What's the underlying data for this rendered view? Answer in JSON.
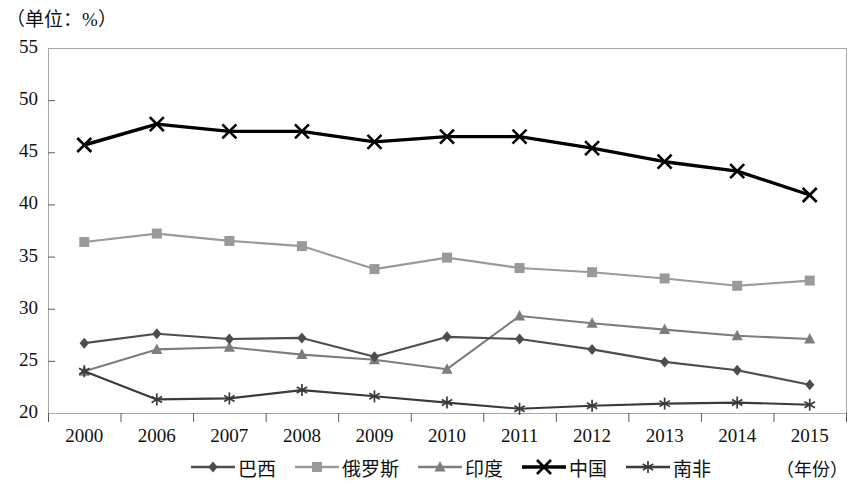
{
  "unit_label": "（单位：%）",
  "xaxis_caption": "（年份）",
  "chart_data": {
    "type": "line",
    "title": "",
    "subtitle": "",
    "xlabel": "（年份）",
    "ylabel": "（单位：%）",
    "categories": [
      "2000",
      "2006",
      "2007",
      "2008",
      "2009",
      "2010",
      "2011",
      "2012",
      "2013",
      "2014",
      "2015"
    ],
    "ylim": [
      20,
      55
    ],
    "yticks": [
      20,
      25,
      30,
      35,
      40,
      45,
      50,
      55
    ],
    "grid": false,
    "legend_position": "bottom",
    "series": [
      {
        "name": "巴西",
        "marker": "diamond",
        "color": "#4d4d4d",
        "values": [
          26.7,
          27.6,
          27.1,
          27.2,
          25.4,
          27.3,
          27.1,
          26.1,
          24.9,
          24.1,
          22.7
        ]
      },
      {
        "name": "俄罗斯",
        "marker": "square",
        "color": "#9a9a9a",
        "values": [
          36.4,
          37.2,
          36.5,
          36.0,
          33.8,
          34.9,
          33.9,
          33.5,
          32.9,
          32.2,
          32.7
        ]
      },
      {
        "name": "印度",
        "marker": "triangle",
        "color": "#7d7d7d",
        "values": [
          24.0,
          26.1,
          26.3,
          25.6,
          25.1,
          24.2,
          29.3,
          28.6,
          28.0,
          27.4,
          27.1
        ]
      },
      {
        "name": "中国",
        "marker": "cross",
        "color": "#000000",
        "values": [
          45.7,
          47.7,
          47.0,
          47.0,
          46.0,
          46.5,
          46.5,
          45.4,
          44.1,
          43.2,
          40.9
        ]
      },
      {
        "name": "南非",
        "marker": "star",
        "color": "#3a3a3a",
        "values": [
          24.0,
          21.3,
          21.4,
          22.2,
          21.6,
          21.0,
          20.4,
          20.7,
          20.9,
          21.0,
          20.8
        ]
      }
    ]
  }
}
